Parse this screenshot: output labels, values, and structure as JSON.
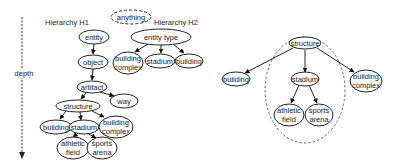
{
  "labels": {
    "hierarchy_h1": "Hierarchy H1",
    "hierarchy_h2": "Hierarchy H2",
    "depth": "depth"
  },
  "left": {
    "nodes": {
      "anything": "anything",
      "entity": "entity",
      "entity_type": "entity type",
      "h2_building_complex_1": "building",
      "h2_building_complex_2": "complex",
      "h2_stadium": "stadium",
      "h2_building": "building",
      "object": "object",
      "artifact": "artifact",
      "way": "way",
      "structure": "structure",
      "building": "building",
      "stadium": "stadium",
      "building_complex_1": "building",
      "building_complex_2": "complex",
      "athletic_field_1": "athletic",
      "athletic_field_2": "field",
      "sports_arena_1": "sports",
      "sports_arena_2": "arena"
    }
  },
  "right": {
    "nodes": {
      "structure": "structure",
      "building": "building",
      "stadium": "stadium",
      "building_complex_1": "building",
      "building_complex_2": "complex",
      "athletic_field_1": "athletic",
      "athletic_field_2": "field",
      "sports_arena_1": "sports",
      "sports_arena_2": "arena"
    }
  }
}
